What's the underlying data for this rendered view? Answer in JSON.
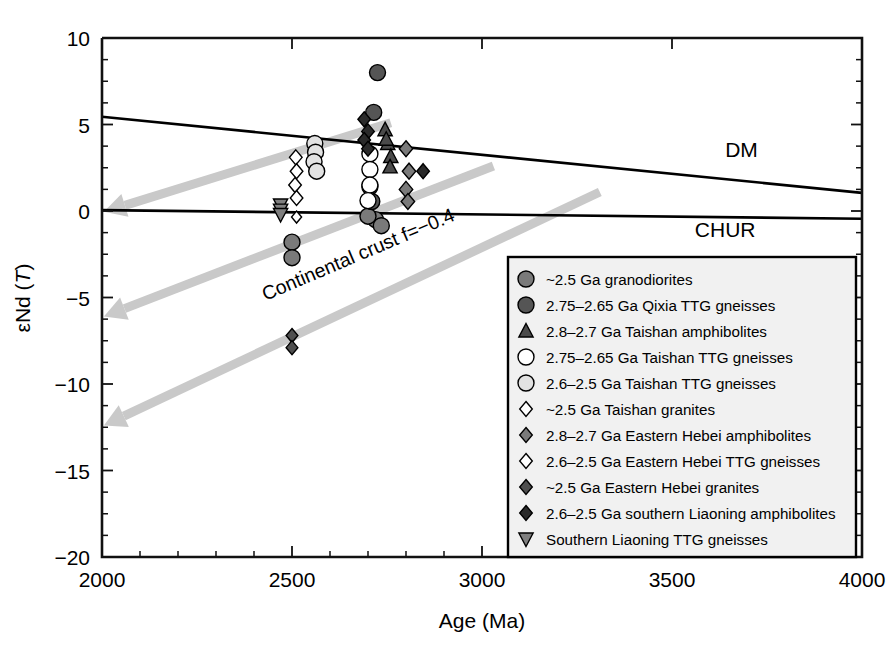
{
  "chart_data": {
    "type": "scatter",
    "title": "",
    "xlabel": "Age (Ma)",
    "ylabel": "εNd (T)",
    "xlim": [
      2000,
      4000
    ],
    "ylim": [
      -20,
      10
    ],
    "xticks": [
      2000,
      2500,
      3000,
      3500,
      4000
    ],
    "xticklabels": [
      "2000",
      "2500",
      "3000",
      "3500",
      "4000"
    ],
    "xminor_step": 100,
    "yticks": [
      10,
      5,
      0,
      -5,
      -10,
      -15,
      -20
    ],
    "yticklabels": [
      "10",
      "5",
      "0",
      "−5",
      "−10",
      "−15",
      "−20"
    ],
    "yminor_step": 1.25,
    "grid": false,
    "legend_position": "bottom-right",
    "reference_lines": [
      {
        "name": "DM",
        "label": "DM",
        "label_x": 3640,
        "label_y": 3.1,
        "points": [
          [
            2000,
            5.45
          ],
          [
            4000,
            1.05
          ]
        ],
        "color": "#000000"
      },
      {
        "name": "CHUR",
        "label": "CHUR",
        "label_x": 3560,
        "label_y": -1.5,
        "points": [
          [
            2000,
            0.05
          ],
          [
            4000,
            -0.45
          ]
        ],
        "color": "#000000"
      }
    ],
    "annotations": [
      {
        "text": "Continental crust f=−0.4",
        "x": 2430,
        "y": -5.2,
        "rotation": -23
      }
    ],
    "evolution_arrows": {
      "color": "#c9c9c9",
      "label": "Continental crust f=-0.4 evolution trends",
      "paths": [
        {
          "from": [
            2760,
            5.1
          ],
          "to": [
            2005,
            -0.05
          ]
        },
        {
          "from": [
            3030,
            2.6
          ],
          "to": [
            2005,
            -6.1
          ]
        },
        {
          "from": [
            3310,
            1.1
          ],
          "to": [
            2005,
            -12.4
          ]
        }
      ]
    },
    "series": [
      {
        "name": "~2.5 Ga granodiorites",
        "marker": "circle",
        "fill": "#7a7a7a",
        "edge": "#1a1a1a",
        "size": 16,
        "points": [
          [
            2500,
            -1.8
          ],
          [
            2500,
            -2.7
          ],
          [
            2720,
            -0.5
          ],
          [
            2735,
            -0.85
          ],
          [
            2700,
            -0.3
          ]
        ]
      },
      {
        "name": "2.75–2.65 Ga Qixia TTG gneisses",
        "marker": "circle",
        "fill": "#555555",
        "edge": "#111111",
        "size": 16,
        "points": [
          [
            2725,
            8.0
          ],
          [
            2715,
            5.7
          ],
          [
            2710,
            0.55
          ],
          [
            2705,
            1.4
          ]
        ]
      },
      {
        "name": "2.8–2.7 Ga Taishan amphibolites",
        "marker": "triangle-up",
        "fill": "#4a4a4a",
        "edge": "#111111",
        "size": 15,
        "points": [
          [
            2745,
            4.7
          ],
          [
            2752,
            3.9
          ],
          [
            2760,
            3.15
          ],
          [
            2758,
            2.55
          ],
          [
            2748,
            4.15
          ]
        ]
      },
      {
        "name": "2.75–2.65 Ga Taishan TTG gneisses",
        "marker": "circle-open",
        "fill": "#ffffff",
        "edge": "#222222",
        "size": 16,
        "points": [
          [
            2705,
            3.3
          ],
          [
            2705,
            2.4
          ],
          [
            2705,
            1.5
          ],
          [
            2700,
            0.6
          ]
        ]
      },
      {
        "name": "2.6–2.5 Ga Taishan TTG gneisses",
        "marker": "circle",
        "fill": "#e2e2e2",
        "edge": "#666666",
        "size": 16,
        "points": [
          [
            2560,
            3.9
          ],
          [
            2562,
            3.4
          ],
          [
            2558,
            2.85
          ],
          [
            2565,
            2.3
          ]
        ]
      },
      {
        "name": "~2.5 Ga Taishan granites",
        "marker": "diamond-open",
        "fill": "#ffffff",
        "edge": "#333333",
        "size": 15,
        "points": [
          [
            2510,
            3.1
          ],
          [
            2512,
            2.3
          ],
          [
            2508,
            1.5
          ],
          [
            2512,
            0.75
          ]
        ]
      },
      {
        "name": "2.8–2.7 Ga Eastern Hebei amphibolites",
        "marker": "diamond",
        "fill": "#7a7a7a",
        "edge": "#1a1a1a",
        "size": 16,
        "points": [
          [
            2800,
            3.6
          ],
          [
            2808,
            2.3
          ],
          [
            2800,
            1.25
          ],
          [
            2805,
            0.55
          ]
        ]
      },
      {
        "name": "2.6–2.5  Ga Eastern Hebei TTG gneisses",
        "marker": "diamond-open",
        "fill": "#ffffff",
        "edge": "#333333",
        "size": 12,
        "points": [
          [
            2512,
            -0.35
          ]
        ]
      },
      {
        "name": "~2.5 Ga Eastern Hebei granites",
        "marker": "diamond",
        "fill": "#4f4f4f",
        "edge": "#111111",
        "size": 14,
        "points": [
          [
            2500,
            -7.2
          ],
          [
            2500,
            -7.9
          ]
        ]
      },
      {
        "name": "2.6–2.5 Ga southern Liaoning amphibolites",
        "marker": "diamond",
        "fill": "#2a2a2a",
        "edge": "#000000",
        "size": 15,
        "points": [
          [
            2690,
            5.3
          ],
          [
            2700,
            4.6
          ],
          [
            2690,
            4.1
          ],
          [
            2700,
            3.6
          ],
          [
            2845,
            2.3
          ]
        ]
      },
      {
        "name": "Southern Liaoning TTG gneisses",
        "marker": "triangle-down",
        "fill": "#7f7f7f",
        "edge": "#1a1a1a",
        "size": 15,
        "points": [
          [
            2470,
            0.35
          ],
          [
            2470,
            0.05
          ],
          [
            2470,
            -0.2
          ]
        ]
      }
    ]
  },
  "legend": {
    "items": [
      {
        "label": "~2.5 Ga granodiorites",
        "marker": "circle",
        "fill": "#7a7a7a"
      },
      {
        "label": "2.75–2.65 Ga Qixia TTG gneisses",
        "marker": "circle",
        "fill": "#555555"
      },
      {
        "label": "2.8–2.7 Ga Taishan amphibolites",
        "marker": "triangle-up",
        "fill": "#4a4a4a"
      },
      {
        "label": "2.75–2.65 Ga Taishan TTG gneisses",
        "marker": "circle-open",
        "fill": "#ffffff"
      },
      {
        "label": "2.6–2.5 Ga Taishan TTG gneisses",
        "marker": "circle",
        "fill": "#e2e2e2"
      },
      {
        "label": "~2.5 Ga Taishan granites",
        "marker": "diamond-open",
        "fill": "#ffffff"
      },
      {
        "label": "2.8–2.7 Ga Eastern Hebei amphibolites",
        "marker": "diamond",
        "fill": "#7a7a7a"
      },
      {
        "label": "2.6–2.5  Ga Eastern Hebei TTG gneisses",
        "marker": "diamond-open",
        "fill": "#ffffff"
      },
      {
        "label": "~2.5 Ga Eastern Hebei granites",
        "marker": "diamond",
        "fill": "#4f4f4f"
      },
      {
        "label": "2.6–2.5 Ga southern Liaoning amphibolites",
        "marker": "diamond",
        "fill": "#2a2a2a"
      },
      {
        "label": "Southern Liaoning TTG gneisses",
        "marker": "triangle-down",
        "fill": "#7f7f7f"
      }
    ],
    "background": "#f1f1f1",
    "border": "#000000"
  }
}
